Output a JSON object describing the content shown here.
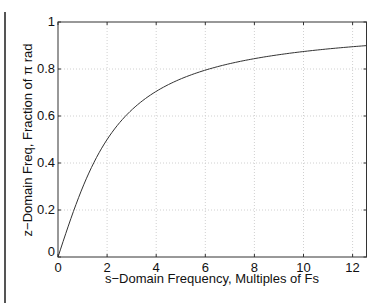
{
  "chart_data": {
    "type": "line",
    "title": "",
    "xlabel": "s−Domain Frequency, Multiples of Fs",
    "ylabel": "z−Domain Freq, Fraction of π rad",
    "xlim": [
      0,
      12.566
    ],
    "ylim": [
      0,
      1
    ],
    "grid": true,
    "legend": null,
    "x_ticks": [
      "0",
      "2",
      "4",
      "6",
      "8",
      "10",
      "12"
    ],
    "y_ticks": [
      "0",
      "0.2",
      "0.4",
      "0.6",
      "0.8",
      "1"
    ],
    "series": [
      {
        "name": "bilinear frequency warping",
        "x": [
          0,
          0.5,
          1,
          1.5,
          2,
          3,
          4,
          5,
          6,
          7,
          8,
          9,
          10,
          11,
          12,
          12.566
        ],
        "values": [
          0,
          0.156,
          0.295,
          0.41,
          0.5,
          0.626,
          0.705,
          0.758,
          0.795,
          0.823,
          0.844,
          0.86,
          0.874,
          0.885,
          0.895,
          0.899
        ]
      }
    ]
  },
  "page": {
    "top_strip_text": "… … …"
  }
}
